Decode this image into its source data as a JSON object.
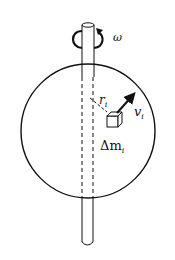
{
  "diagram": {
    "labels": {
      "omega": "ω",
      "r_main": "r",
      "r_sub": "i",
      "v_main": "v",
      "v_sub": "i",
      "dm_main": "Δm",
      "dm_sub": "i"
    },
    "colors": {
      "stroke": "#111111",
      "background": "#ffffff"
    },
    "elements": [
      "rotation-axis-rod",
      "sphere",
      "angular-velocity-arrow",
      "radius-line",
      "mass-element-cube",
      "velocity-arrow"
    ]
  }
}
